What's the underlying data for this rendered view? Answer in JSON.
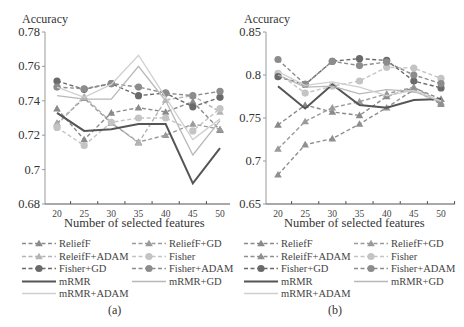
{
  "chart_data": [
    {
      "type": "line",
      "panel": "(a)",
      "title": "",
      "ylabel": "Accuracy",
      "xlabel": "Number of selected features",
      "x": [
        20,
        25,
        30,
        35,
        40,
        45,
        50
      ],
      "ylim": [
        0.68,
        0.78
      ],
      "yticks": [
        0.68,
        0.7,
        0.72,
        0.74,
        0.76,
        0.78
      ],
      "ytick_labels": [
        "0.68",
        "0.7",
        "0.72",
        "0.74",
        "0.76",
        "0.78"
      ],
      "grid": false,
      "legend_position": "bottom",
      "series": [
        {
          "name": "ReliefF",
          "style": "dashed",
          "marker": "triangle",
          "color": "#8a8a8a",
          "values": [
            0.7355,
            0.7175,
            0.733,
            0.736,
            0.7335,
            0.7395,
            0.723
          ]
        },
        {
          "name": "ReliefF+GD",
          "style": "dashed",
          "marker": "triangle",
          "color": "#9a9a9a",
          "values": [
            0.727,
            0.7415,
            0.727,
            0.716,
            0.72,
            0.7265,
            0.7235
          ]
        },
        {
          "name": "ReleifF+ADAM",
          "style": "dashed",
          "marker": "triangle",
          "color": "#b4b4b4",
          "values": [
            0.726,
            0.7425,
            0.7275,
            0.7155,
            0.7405,
            0.743,
            0.7335
          ]
        },
        {
          "name": "Fisher",
          "style": "dashed",
          "marker": "circle",
          "color": "#c4c4c4",
          "values": [
            0.7245,
            0.714,
            0.7275,
            0.73,
            0.73,
            0.7225,
            0.7355
          ]
        },
        {
          "name": "Fisher+GD",
          "style": "dashed",
          "marker": "circle",
          "color": "#6a6a6a",
          "values": [
            0.7515,
            0.7467,
            0.75,
            0.743,
            0.7445,
            0.7365,
            0.742
          ]
        },
        {
          "name": "Fisher+ADAM",
          "style": "dashed",
          "marker": "circle",
          "color": "#8c8c8c",
          "values": [
            0.748,
            0.747,
            0.75,
            0.748,
            0.7445,
            0.743,
            0.7455
          ]
        },
        {
          "name": "mRMR",
          "style": "solid",
          "marker": "none",
          "color": "#555555",
          "width": 2,
          "values": [
            0.733,
            0.7225,
            0.7235,
            0.7265,
            0.7265,
            0.692,
            0.7125
          ]
        },
        {
          "name": "mRMR+GD",
          "style": "solid",
          "marker": "none",
          "color": "#b8b8b8",
          "width": 1.3,
          "values": [
            0.743,
            0.741,
            0.741,
            0.76,
            0.74,
            0.7085,
            0.7285
          ]
        },
        {
          "name": "mRMR+ADAM",
          "style": "solid",
          "marker": "none",
          "color": "#cfcfcf",
          "width": 1.3,
          "values": [
            0.748,
            0.742,
            0.7495,
            0.7665,
            0.742,
            0.7175,
            0.7295
          ]
        }
      ]
    },
    {
      "type": "line",
      "panel": "(b)",
      "title": "",
      "ylabel": "Accuracy",
      "xlabel": "Number of selected features",
      "x": [
        20,
        25,
        30,
        35,
        40,
        45,
        50
      ],
      "ylim": [
        0.65,
        0.85
      ],
      "yticks": [
        0.65,
        0.7,
        0.75,
        0.8,
        0.85
      ],
      "ytick_labels": [
        "0.65",
        "0.7",
        "0.75",
        "0.8",
        "0.85"
      ],
      "grid": false,
      "legend_position": "bottom",
      "series": [
        {
          "name": "ReliefF",
          "style": "dashed",
          "marker": "triangle",
          "color": "#8a8a8a",
          "values": [
            0.742,
            0.765,
            0.757,
            0.753,
            0.775,
            0.785,
            0.772
          ]
        },
        {
          "name": "ReliefF+GD",
          "style": "dashed",
          "marker": "triangle",
          "color": "#9a9a9a",
          "values": [
            0.714,
            0.746,
            0.762,
            0.769,
            0.778,
            0.786,
            0.768
          ]
        },
        {
          "name": "ReleifF+ADAM",
          "style": "dashed",
          "marker": "triangle",
          "color": "#8f8f8f",
          "values": [
            0.684,
            0.719,
            0.726,
            0.743,
            0.762,
            0.783,
            0.766
          ]
        },
        {
          "name": "Fisher",
          "style": "dashed",
          "marker": "circle",
          "color": "#c4c4c4",
          "values": [
            0.802,
            0.779,
            0.787,
            0.793,
            0.809,
            0.808,
            0.796
          ]
        },
        {
          "name": "Fisher+GD",
          "style": "dashed",
          "marker": "circle",
          "color": "#6a6a6a",
          "values": [
            0.798,
            0.789,
            0.816,
            0.819,
            0.817,
            0.793,
            0.785
          ]
        },
        {
          "name": "Fisher+ADAM",
          "style": "dashed",
          "marker": "circle",
          "color": "#8c8c8c",
          "values": [
            0.818,
            0.789,
            0.816,
            0.811,
            0.815,
            0.8,
            0.79
          ]
        },
        {
          "name": "mRMR",
          "style": "solid",
          "marker": "none",
          "color": "#555555",
          "width": 2,
          "values": [
            0.787,
            0.761,
            0.789,
            0.765,
            0.762,
            0.771,
            0.772
          ]
        },
        {
          "name": "mRMR+GD",
          "style": "solid",
          "marker": "none",
          "color": "#b8b8b8",
          "width": 1.3,
          "values": [
            0.8,
            0.786,
            0.787,
            0.778,
            0.783,
            0.781,
            0.769
          ]
        },
        {
          "name": "mRMR+ADAM",
          "style": "solid",
          "marker": "none",
          "color": "#cfcfcf",
          "width": 1.3,
          "values": [
            0.804,
            0.788,
            0.792,
            0.786,
            0.776,
            0.782,
            0.77
          ]
        }
      ]
    }
  ],
  "panels": {
    "a": {
      "ylabel": "Accuracy",
      "xlabel": "Number of selected features",
      "caption": "(a)"
    },
    "b": {
      "ylabel": "Accuracy",
      "xlabel": "Number of selected features",
      "caption": "(b)"
    }
  },
  "legend": {
    "items": [
      "ReliefF",
      "ReliefF+GD",
      "ReleifF+ADAM",
      "Fisher",
      "Fisher+GD",
      "Fisher+ADAM",
      "mRMR",
      "mRMR+GD",
      "mRMR+ADAM"
    ]
  }
}
